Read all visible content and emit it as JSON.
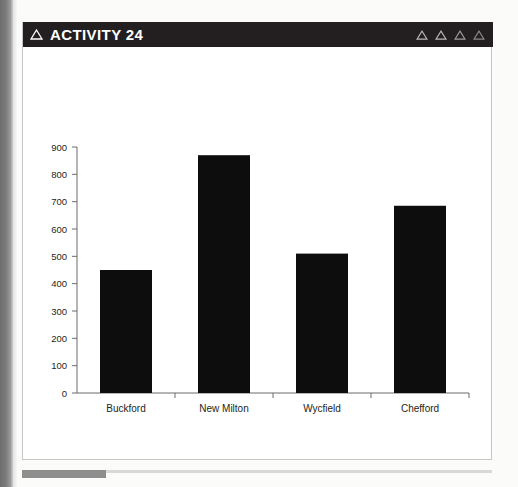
{
  "window": {
    "header": {
      "title": "ACTIVITY 24",
      "title_icon": "triangle-outline-icon",
      "background_color": "#231f20",
      "text_color": "#ffffff",
      "right_icons": [
        "triangle-outline-icon",
        "triangle-outline-icon",
        "triangle-outline-icon",
        "triangle-outline-icon"
      ]
    },
    "background_color": "#ffffff",
    "border_color": "#c6c6c6"
  },
  "chart_data": {
    "type": "bar",
    "title": "",
    "xlabel": "",
    "ylabel": "",
    "categories": [
      "Buckford",
      "New Milton",
      "Wycfield",
      "Chefford"
    ],
    "values": [
      450,
      870,
      510,
      685
    ],
    "ylim": [
      0,
      900
    ],
    "yticks": [
      0,
      100,
      200,
      300,
      400,
      500,
      600,
      700,
      800,
      900
    ],
    "ytick_labels": [
      "0",
      "100",
      "200",
      "300",
      "400",
      "500",
      "600",
      "700",
      "800",
      "900"
    ],
    "grid": false,
    "legend": null,
    "bar_color": "#0d0d0d",
    "axis_color": "#6b6b6b",
    "tick_label_color": "#231f20"
  }
}
